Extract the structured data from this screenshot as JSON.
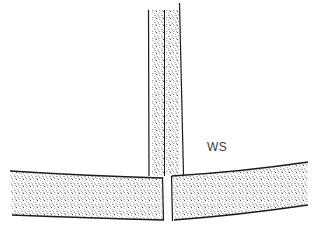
{
  "diagram": {
    "type": "cross-section line drawing",
    "labels": [
      {
        "text": "WS",
        "x": 207,
        "y": 141
      }
    ],
    "colors": {
      "background": "#ffffff",
      "line": "#1a1a1a",
      "stipple": "#2b2b2b"
    },
    "elements": {
      "vertical_wall": {
        "description": "two parallel stippled vertical strips with center seam"
      },
      "left_slab": {
        "description": "curved stippled horizontal slab, left segment"
      },
      "right_slab": {
        "description": "curved stippled horizontal slab, right segment"
      },
      "gap": {
        "description": "narrow vertical gap between slab segments below wall"
      }
    }
  }
}
